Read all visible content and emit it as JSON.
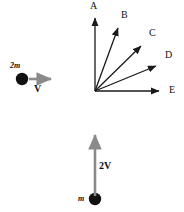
{
  "figure": {
    "background_color": "#ffffff",
    "width": 184,
    "height": 212
  },
  "left_object": {
    "mass_label": "2m",
    "velocity_label": "V",
    "body_color": "#111111",
    "arrow_color": "#8a8a8a",
    "arrow_direction": "right",
    "body": {
      "cx": 22,
      "cy": 79,
      "r": 6
    },
    "arrow": {
      "x1": 29,
      "y1": 79,
      "x2": 56,
      "y2": 79
    },
    "mass_label_pos": {
      "x": 10,
      "y": 62
    },
    "velocity_label_pos": {
      "x": 34,
      "y": 84
    }
  },
  "bottom_object": {
    "mass_label": "m",
    "velocity_label": "2V",
    "body_color": "#111111",
    "arrow_color": "#8a8a8a",
    "arrow_direction": "up",
    "body": {
      "cx": 95,
      "cy": 199,
      "r": 6
    },
    "arrow": {
      "x1": 95,
      "y1": 196,
      "x2": 95,
      "y2": 130
    },
    "mass_label_pos": {
      "x": 78,
      "y": 195
    },
    "velocity_label_pos": {
      "x": 99,
      "y": 161
    }
  },
  "vector_fan": {
    "origin": {
      "x": 95,
      "y": 91
    },
    "color": "#1a1a1a",
    "vectors": [
      {
        "label": "A",
        "tip": {
          "x": 95,
          "y": 12
        },
        "label_pos": {
          "x": 90,
          "y": 1
        },
        "angle_deg": 90
      },
      {
        "label": "B",
        "tip": {
          "x": 120,
          "y": 23
        },
        "label_pos": {
          "x": 121,
          "y": 10
        },
        "angle_deg": 69
      },
      {
        "label": "C",
        "tip": {
          "x": 145,
          "y": 41
        },
        "label_pos": {
          "x": 149,
          "y": 28
        },
        "angle_deg": 45
      },
      {
        "label": "D",
        "tip": {
          "x": 161,
          "y": 62
        },
        "label_pos": {
          "x": 165,
          "y": 50
        },
        "angle_deg": 24
      },
      {
        "label": "E",
        "tip": {
          "x": 164,
          "y": 91
        },
        "label_pos": {
          "x": 169,
          "y": 85
        },
        "angle_deg": 0
      }
    ]
  }
}
